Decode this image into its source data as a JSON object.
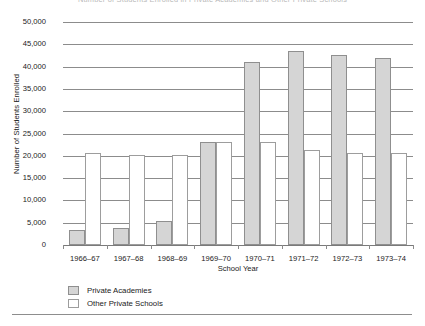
{
  "chart_data": {
    "type": "bar",
    "title": "Number of Students Enrolled in Private Academies and Other Private Schools",
    "xlabel": "School Year",
    "ylabel": "Number of Students Enrolled",
    "categories": [
      "1966–67",
      "1967–68",
      "1968–69",
      "1969–70",
      "1970–71",
      "1971–72",
      "1972–73",
      "1973–74"
    ],
    "series": [
      {
        "name": "Private Academies",
        "color": "#d5d5d5",
        "values": [
          3300,
          3800,
          5400,
          23000,
          41000,
          43500,
          42500,
          42000
        ]
      },
      {
        "name": "Other Private Schools",
        "color": "#ffffff",
        "values": [
          20600,
          20200,
          20200,
          23100,
          23000,
          21400,
          20600,
          20700
        ]
      }
    ],
    "ylim": [
      0,
      50000
    ],
    "ytick_values": [
      0,
      5000,
      10000,
      15000,
      20000,
      25000,
      30000,
      35000,
      40000,
      45000,
      50000
    ],
    "ytick_labels": [
      "0",
      "5,000",
      "10,000",
      "15,000",
      "20,000",
      "25,000",
      "30,000",
      "35,000",
      "40,000",
      "45,000",
      "50,000"
    ],
    "grid": true,
    "legend_position": "bottom-left"
  },
  "legend": {
    "items": [
      {
        "label": "Private Academies",
        "swatch": "academies"
      },
      {
        "label": "Other Private Schools",
        "swatch": "other"
      }
    ]
  }
}
